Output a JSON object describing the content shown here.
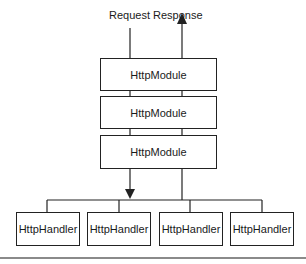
{
  "diagram": {
    "labels": {
      "request": "Request",
      "response": "Response"
    },
    "modules": [
      {
        "label": "HttpModule"
      },
      {
        "label": "HttpModule"
      },
      {
        "label": "HttpModule"
      }
    ],
    "handlers": [
      {
        "label": "HttpHandler"
      },
      {
        "label": "HttpHandler"
      },
      {
        "label": "HttpHandler"
      },
      {
        "label": "HttpHandler"
      }
    ],
    "colors": {
      "line": "#222222",
      "rule": "#8a8a8a"
    }
  }
}
